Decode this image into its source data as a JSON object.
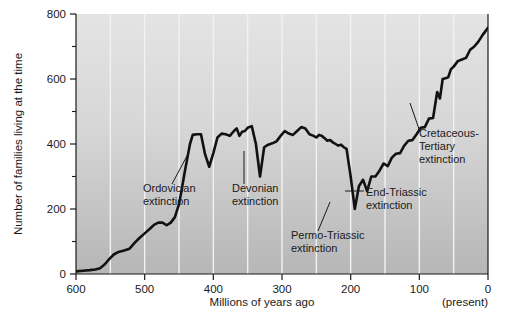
{
  "chart_data": {
    "type": "line",
    "title": "",
    "xlabel": "Millions of years ago",
    "ylabel": "Number of families living at the time",
    "xlim": [
      600,
      0
    ],
    "ylim": [
      0,
      800
    ],
    "x_ticks": [
      600,
      500,
      400,
      300,
      200,
      100,
      0
    ],
    "x_tick_labels": [
      "600",
      "500",
      "400",
      "300",
      "200",
      "100",
      "0"
    ],
    "x_minor_ticks": [
      550,
      450,
      350,
      250,
      150,
      50
    ],
    "y_ticks": [
      0,
      200,
      400,
      600,
      800
    ],
    "y_tick_labels": [
      "0",
      "200",
      "400",
      "600",
      "800"
    ],
    "y_minor_ticks": [
      100,
      300,
      500,
      700
    ],
    "x_axis_note": "(present)",
    "grid": "vertical white gridlines at major and minor x ticks",
    "legend": "none",
    "series": [
      {
        "name": "Number of families",
        "x": [
          600,
          590,
          580,
          572,
          565,
          558,
          552,
          545,
          538,
          530,
          522,
          515,
          508,
          500,
          492,
          486,
          480,
          474,
          468,
          462,
          456,
          450,
          446,
          442,
          438,
          434,
          430,
          424,
          418,
          412,
          406,
          400,
          394,
          388,
          382,
          376,
          370,
          366,
          362,
          358,
          354,
          350,
          344,
          338,
          332,
          326,
          320,
          314,
          308,
          302,
          296,
          290,
          284,
          278,
          272,
          266,
          260,
          254,
          250,
          246,
          242,
          238,
          234,
          230,
          226,
          222,
          218,
          214,
          210,
          206,
          200,
          194,
          188,
          182,
          176,
          170,
          164,
          158,
          152,
          146,
          140,
          134,
          128,
          122,
          116,
          110,
          104,
          98,
          92,
          86,
          80,
          74,
          70,
          66,
          62,
          58,
          54,
          50,
          44,
          38,
          32,
          26,
          20,
          14,
          8,
          2,
          0
        ],
        "y": [
          8,
          10,
          12,
          14,
          18,
          30,
          45,
          60,
          68,
          72,
          78,
          95,
          110,
          125,
          140,
          152,
          158,
          158,
          150,
          158,
          175,
          215,
          260,
          310,
          355,
          400,
          428,
          430,
          430,
          368,
          330,
          372,
          420,
          432,
          430,
          425,
          440,
          448,
          425,
          438,
          440,
          450,
          455,
          400,
          300,
          390,
          398,
          402,
          408,
          425,
          440,
          432,
          428,
          440,
          452,
          448,
          430,
          425,
          420,
          428,
          425,
          418,
          410,
          412,
          405,
          400,
          395,
          398,
          390,
          385,
          300,
          200,
          270,
          290,
          255,
          300,
          300,
          318,
          340,
          332,
          358,
          370,
          372,
          395,
          410,
          412,
          430,
          450,
          452,
          478,
          480,
          560,
          540,
          600,
          602,
          605,
          630,
          638,
          655,
          660,
          665,
          690,
          700,
          715,
          735,
          752,
          758
        ]
      }
    ],
    "annotations": [
      {
        "id": "ordovician",
        "lines": [
          "Ordovician",
          "extinction"
        ],
        "text_x": 143,
        "text_y": 192,
        "leader": {
          "x1": 188,
          "y1": 154,
          "x2": 172,
          "y2": 184
        }
      },
      {
        "id": "devonian",
        "lines": [
          "Devonian",
          "extinction"
        ],
        "text_x": 232,
        "text_y": 192,
        "leader": {
          "x1": 244,
          "y1": 151,
          "x2": 244,
          "y2": 184
        }
      },
      {
        "id": "permo-triassic",
        "lines": [
          "Permo-Triassic",
          "extinction"
        ],
        "text_x": 291,
        "text_y": 239,
        "leader": {
          "x1": 330,
          "y1": 202,
          "x2": 318,
          "y2": 231
        }
      },
      {
        "id": "end-triassic",
        "lines": [
          "End-Triassic",
          "extinction"
        ],
        "text_x": 366,
        "text_y": 196,
        "leader": {
          "x1": 345,
          "y1": 191,
          "x2": 364,
          "y2": 191
        }
      },
      {
        "id": "cretaceous-tertiary",
        "lines": [
          "Cretaceous-",
          "Tertiary",
          "extinction"
        ],
        "text_x": 419,
        "text_y": 137,
        "leader": {
          "x1": 410,
          "y1": 103,
          "x2": 419,
          "y2": 129
        }
      }
    ]
  },
  "colors": {
    "line": "#111111",
    "plot_bg_top": "#e2e2e2",
    "plot_bg_bottom": "#b9b9b9",
    "gridline": "#f2f2f2",
    "axis": "#1a1a1a",
    "text": "#1a1a1a",
    "page_bg": "#ffffff"
  }
}
